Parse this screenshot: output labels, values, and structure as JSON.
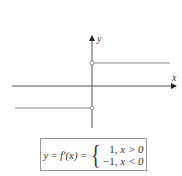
{
  "diagram": {
    "axes": {
      "x_label": "x",
      "y_label": "y"
    },
    "function": {
      "lhs_y": "y",
      "lhs_eq": " = ",
      "lhs_f": "f′(x)",
      "lhs_eq2": " = ",
      "cases": [
        {
          "value": "1,",
          "condition": "x > 0"
        },
        {
          "value": "−1,",
          "condition": "x < 0"
        }
      ]
    },
    "colors": {
      "line": "#888888",
      "axis": "#333333",
      "box_border": "#999999"
    }
  }
}
